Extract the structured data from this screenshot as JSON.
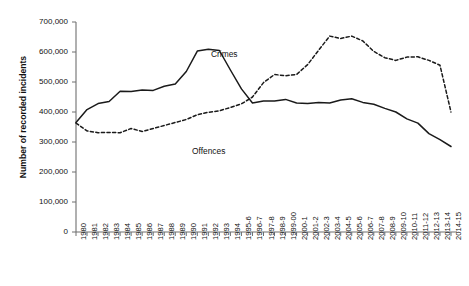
{
  "chart_data": {
    "type": "line",
    "title": "",
    "xlabel": "",
    "ylabel": "Number of recorded incidents",
    "ylim": [
      0,
      700000
    ],
    "ytick_values": [
      0,
      100000,
      200000,
      300000,
      400000,
      500000,
      600000,
      700000
    ],
    "ytick_labels": [
      "0",
      "100,000",
      "200,000",
      "300,000",
      "400,000",
      "500,000",
      "600,000",
      "700,000"
    ],
    "grid": false,
    "legend_position": "inline-annotation",
    "categories": [
      "1980",
      "1981",
      "1982",
      "1983",
      "1984",
      "1985",
      "1986",
      "1987",
      "1988",
      "1989",
      "1990",
      "1991",
      "1992",
      "1993",
      "1994",
      "1995-6",
      "1996-7",
      "1997-8",
      "1998-9",
      "1999-00",
      "2000-1",
      "2001-2",
      "2002-3",
      "2003-4",
      "2004-5",
      "2005-6",
      "2006-7",
      "2007-8",
      "2008-9",
      "2009-10",
      "2010-11",
      "2011-12",
      "2012-13",
      "2013-14",
      "2014-15"
    ],
    "series": [
      {
        "name": "Crimes",
        "style": "solid",
        "color": "#1a1a1a",
        "values": [
          365000,
          408000,
          428000,
          435000,
          469000,
          468000,
          473000,
          472000,
          486000,
          493000,
          535000,
          603000,
          609000,
          605000,
          540000,
          477000,
          430000,
          437000,
          437000,
          442000,
          430000,
          428000,
          432000,
          430000,
          440000,
          444000,
          432000,
          426000,
          412000,
          400000,
          377000,
          363000,
          328000,
          308000,
          285000
        ]
      },
      {
        "name": "Offences",
        "style": "dashed",
        "color": "#1a1a1a",
        "values": [
          363000,
          337000,
          331000,
          332000,
          331000,
          345000,
          335000,
          345000,
          355000,
          365000,
          375000,
          391000,
          399000,
          404000,
          415000,
          427000,
          450000,
          498000,
          525000,
          521000,
          525000,
          558000,
          606000,
          653000,
          645000,
          653000,
          637000,
          602000,
          581000,
          572000,
          583000,
          584000,
          572000,
          556000,
          400000
        ]
      }
    ],
    "annotations": [
      {
        "text": "Crimes",
        "x_px": 211,
        "y_px": 49
      },
      {
        "text": "Offences",
        "x_px": 192,
        "y_px": 146
      }
    ],
    "axis": {
      "plot_left_px": 76,
      "plot_right_px": 457,
      "plot_top_px": 22,
      "plot_bottom_px": 232
    }
  }
}
